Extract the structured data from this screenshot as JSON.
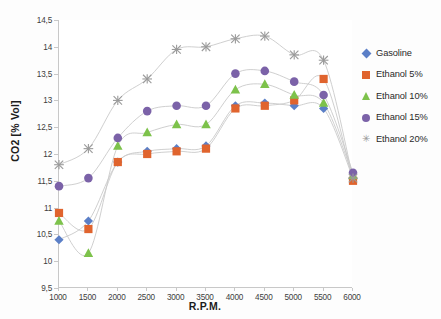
{
  "chart_data": {
    "type": "scatter",
    "title": "",
    "xlabel": "R.P.M.",
    "ylabel": "CO2 [% Vol]",
    "xlim": [
      1000,
      6000
    ],
    "ylim": [
      9.5,
      14.5
    ],
    "ytick_step": 0.5,
    "xtick_step": 500,
    "grid": false,
    "decimal_separator": ",",
    "legend_position": "right",
    "x": [
      1000,
      1500,
      2000,
      2500,
      3000,
      3500,
      4000,
      4500,
      5000,
      5500,
      6000
    ],
    "xtick_labels": [
      "1000",
      "1500",
      "2000",
      "2500",
      "3000",
      "3500",
      "4000",
      "4500",
      "5000",
      "5500",
      "6000"
    ],
    "ytick_labels": [
      "9,5",
      "10",
      "10,5",
      "11",
      "11,5",
      "12",
      "12,5",
      "13",
      "13,5",
      "14",
      "14,5"
    ],
    "ytick_values": [
      9.5,
      10,
      10.5,
      11,
      11.5,
      12,
      12.5,
      13,
      13.5,
      14,
      14.5
    ],
    "series": [
      {
        "name": "Gasoline",
        "marker": "diamond",
        "color": "#5B7FC7",
        "values": [
          10.4,
          10.75,
          11.85,
          12.05,
          12.1,
          12.15,
          12.9,
          12.95,
          12.9,
          12.85,
          11.55
        ]
      },
      {
        "name": "Ethanol 5%",
        "marker": "square",
        "color": "#E0642E",
        "values": [
          10.9,
          10.6,
          11.85,
          12.0,
          12.05,
          12.1,
          12.85,
          12.9,
          13.0,
          13.4,
          11.5
        ]
      },
      {
        "name": "Ethanol 10%",
        "marker": "triangle",
        "color": "#7DC24B",
        "values": [
          10.75,
          10.15,
          12.15,
          12.4,
          12.55,
          12.55,
          13.2,
          13.3,
          13.1,
          12.95,
          11.6
        ]
      },
      {
        "name": "Ethanol 15%",
        "marker": "circle",
        "color": "#7B62A8",
        "values": [
          11.4,
          11.55,
          12.3,
          12.8,
          12.9,
          12.9,
          13.5,
          13.55,
          13.35,
          13.1,
          11.65
        ]
      },
      {
        "name": "Ethanol 20%",
        "marker": "x",
        "color": "#9a9a9a",
        "values": [
          11.8,
          12.1,
          13.0,
          13.4,
          13.95,
          14.0,
          14.15,
          14.2,
          13.85,
          13.75,
          11.55
        ]
      }
    ]
  },
  "legend": {
    "items": [
      {
        "label": "Gasoline",
        "marker": "diamond-marker-icon"
      },
      {
        "label": "Ethanol 5%",
        "marker": "square-marker-icon"
      },
      {
        "label": "Ethanol 10%",
        "marker": "triangle-marker-icon"
      },
      {
        "label": "Ethanol 15%",
        "marker": "circle-marker-icon"
      },
      {
        "label": "Ethanol 20%",
        "marker": "x-marker-icon"
      }
    ]
  }
}
